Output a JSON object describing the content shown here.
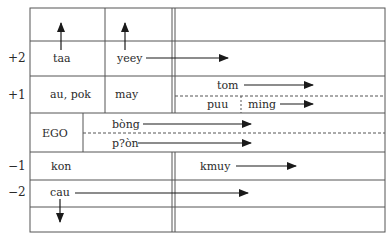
{
  "diagram": {
    "type": "kinship-terminology-chart",
    "colors": {
      "line": "#555555",
      "arrow": "#1a1a1a",
      "text": "#2a2a2a",
      "background": "#ffffff"
    },
    "generation_labels": [
      {
        "id": "gen-plus2",
        "label": "+2"
      },
      {
        "id": "gen-plus1",
        "label": "+1"
      },
      {
        "id": "gen-minus1",
        "label": "−1"
      },
      {
        "id": "gen-minus2",
        "label": "−2"
      }
    ],
    "terms": {
      "taa": "taa",
      "yeey": "yeey",
      "au_pok": "au, pok",
      "may": "may",
      "tom": "tom",
      "puu": "puu",
      "ming": "ming",
      "ego": "EGO",
      "bong": "bòng",
      "pon": "p?òn",
      "kon": "kon",
      "kmuy": "kmuy",
      "cau": "cau"
    },
    "arrows": [
      {
        "from": "taa",
        "direction": "up"
      },
      {
        "from": "yeey",
        "direction": "up"
      },
      {
        "from": "yeey",
        "direction": "right"
      },
      {
        "from": "tom",
        "direction": "right"
      },
      {
        "from": "ming",
        "direction": "right"
      },
      {
        "from": "bong",
        "direction": "right"
      },
      {
        "from": "pon",
        "direction": "right"
      },
      {
        "from": "kmuy",
        "direction": "right"
      },
      {
        "from": "cau",
        "direction": "right"
      },
      {
        "from": "cau",
        "direction": "down"
      }
    ]
  }
}
